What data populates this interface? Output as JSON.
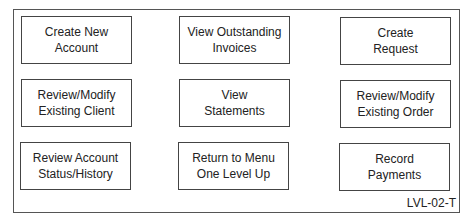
{
  "menu": {
    "buttons": [
      {
        "label": "Create New\nAccount"
      },
      {
        "label": "View Outstanding\nInvoices"
      },
      {
        "label": "Create\nRequest"
      },
      {
        "label": "Review/Modify\nExisting Client"
      },
      {
        "label": "View\nStatements"
      },
      {
        "label": "Review/Modify\nExisting Order"
      },
      {
        "label": "Review Account\nStatus/History"
      },
      {
        "label": "Return to Menu\nOne Level Up"
      },
      {
        "label": "Record\nPayments"
      }
    ],
    "screen_code": "LVL-02-T"
  }
}
